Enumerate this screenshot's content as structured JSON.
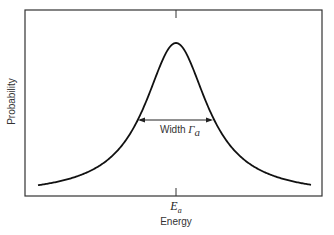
{
  "chart_data": {
    "type": "line",
    "title": "",
    "xlabel": "Energy",
    "ylabel": "Probability",
    "x_ticks": [
      "E_a"
    ],
    "curve": "Lorentzian resonance peak centered at E_a",
    "annotation": {
      "text": "Width Γ_a",
      "type": "double-arrow at half maximum"
    },
    "grid": false,
    "legend": null,
    "series": [
      {
        "name": "Probability",
        "x": [
          -138,
          -100,
          -76,
          -57,
          -38,
          -19,
          0,
          19,
          38,
          57,
          76,
          100,
          138
        ],
        "values": [
          0.07,
          0.13,
          0.2,
          0.31,
          0.5,
          0.8,
          1.0,
          0.8,
          0.5,
          0.31,
          0.2,
          0.13,
          0.07
        ]
      }
    ]
  },
  "labels": {
    "ylabel": "Probability",
    "xlabel": "Energy",
    "tick_main": "E",
    "tick_sub": "a",
    "width_text": "Width ",
    "width_symbol": "Γ",
    "width_sub": "a"
  }
}
